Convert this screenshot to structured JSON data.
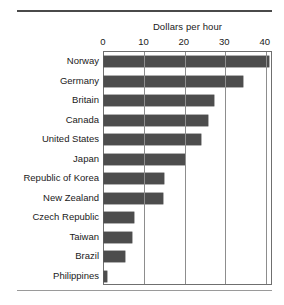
{
  "chart_data": {
    "type": "bar",
    "orientation": "horizontal",
    "title": "Dollars per hour",
    "xlabel": "Dollars per hour",
    "ylabel": "",
    "xlim": [
      0,
      41.8
    ],
    "xticks": [
      0,
      10,
      20,
      30,
      40
    ],
    "xticklabels": [
      "0",
      "10",
      "20",
      "30",
      "40"
    ],
    "grid": "vertical",
    "legend": "none",
    "bar_color": "#4d4d4d",
    "categories": [
      "Norway",
      "Germany",
      "Britain",
      "Canada",
      "United States",
      "Japan",
      "Republic of Korea",
      "New Zealand",
      "Czech Republic",
      "Taiwan",
      "Brazil",
      "Philippines"
    ],
    "values": [
      40.9,
      34.5,
      27.2,
      25.6,
      23.9,
      20.0,
      14.8,
      14.7,
      7.3,
      6.9,
      5.2,
      0.8
    ]
  }
}
